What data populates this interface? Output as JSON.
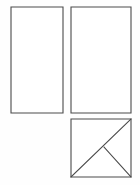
{
  "page": {
    "background_color": "#fefefe",
    "width": 140,
    "height": 185
  },
  "style": {
    "stroke_color": "#4a4a4a",
    "fill_color": "#ffffff",
    "stroke_width": 1.1
  },
  "shapes": [
    {
      "id": "rect-left",
      "label": "Left tall rectangle",
      "type": "rectangle",
      "x": 11,
      "y": 7,
      "width": 52,
      "height": 106,
      "subdivisions": []
    },
    {
      "id": "rect-right",
      "label": "Right tall rectangle",
      "type": "rectangle",
      "x": 71,
      "y": 7,
      "width": 60,
      "height": 106,
      "subdivisions": []
    },
    {
      "id": "square-tangram",
      "label": "Bottom right subdivided square",
      "type": "square",
      "x": 71,
      "y": 119,
      "width": 60,
      "height": 58,
      "subdivisions": [
        {
          "id": "diagonal-main",
          "label": "Main diagonal bottom-left to top-right",
          "type": "line",
          "x1": 71,
          "y1": 177,
          "x2": 131,
          "y2": 119
        },
        {
          "id": "diagonal-minor",
          "label": "Minor diagonal midpoint to bottom-right",
          "type": "line",
          "x1": 104,
          "y1": 147,
          "x2": 131,
          "y2": 177
        }
      ]
    }
  ]
}
